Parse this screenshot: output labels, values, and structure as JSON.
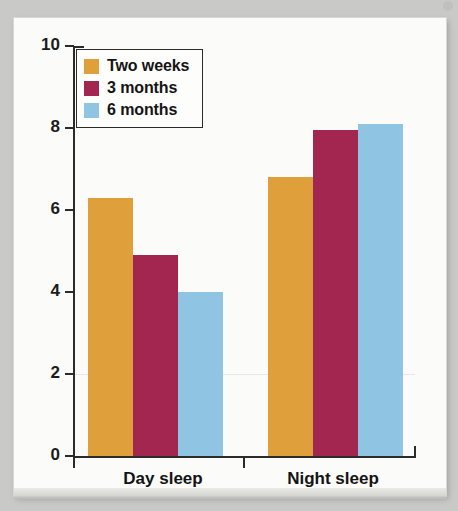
{
  "figure": {
    "background_color": "#c9c9c7",
    "paper_color": "#fbfbf9"
  },
  "legend": {
    "position": "top-left-inside",
    "entries": [
      {
        "label": "Two weeks",
        "color": "#dfa03c"
      },
      {
        "label": "3 months",
        "color": "#a32651"
      },
      {
        "label": "6 months",
        "color": "#8fc4e3"
      }
    ]
  },
  "axes": {
    "y_ticks": [
      "10",
      "8",
      "6",
      "4",
      "2",
      "0"
    ],
    "x_categories": [
      "Day sleep",
      "Night sleep"
    ]
  },
  "chart_data": {
    "type": "bar",
    "title": "",
    "subtitle": "",
    "xlabel": "",
    "ylabel": "",
    "categories": [
      "Day sleep",
      "Night sleep"
    ],
    "series": [
      {
        "name": "Two weeks",
        "color": "#dfa03c",
        "values": [
          6.3,
          6.8
        ]
      },
      {
        "name": "3 months",
        "color": "#a32651",
        "values": [
          4.9,
          7.95
        ]
      },
      {
        "name": "6 months",
        "color": "#8fc4e3",
        "values": [
          4.0,
          8.1
        ]
      }
    ],
    "ylim": [
      0,
      10
    ],
    "ytick_values": [
      0,
      2,
      4,
      6,
      8,
      10
    ],
    "grid": false,
    "legend_position": "upper left"
  }
}
